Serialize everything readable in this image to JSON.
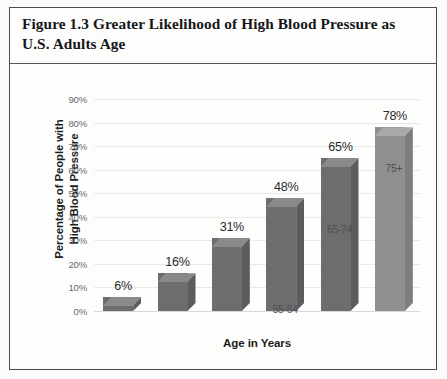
{
  "figure": {
    "title": "Figure 1.3 Greater Likelihood of High Blood Pressure as U.S. Adults Age"
  },
  "axis_titles": {
    "y_line1": "Percentage of People with",
    "y_line2": "High Blood Pressure",
    "x": "Age in Years"
  },
  "colors": {
    "bar_front": "#6d6d6f",
    "bar_side": "#5c5c5e",
    "bar_top": "#8a8a8c",
    "bar_front_last": "#8f8f91",
    "gridline": "#e9e9ea",
    "frame": "#4c4c50",
    "paper": "#fdfdfc"
  },
  "chart_data": {
    "type": "bar",
    "title": "Figure 1.3 Greater Likelihood of High Blood Pressure as U.S. Adults Age",
    "xlabel": "Age in Years",
    "ylabel": "Percentage of People with High Blood Pressure",
    "categories": [
      "18-34",
      "35-44",
      "45-54",
      "55-64",
      "65-74",
      "75+"
    ],
    "values": [
      6,
      16,
      31,
      48,
      65,
      78
    ],
    "value_labels": [
      "6%",
      "16%",
      "31%",
      "48%",
      "65%",
      "78%"
    ],
    "ylim": [
      0,
      90
    ],
    "ytick_values": [
      0,
      10,
      20,
      30,
      40,
      50,
      60,
      70,
      80,
      90
    ],
    "ytick_labels": [
      "0%",
      "10%",
      "20%",
      "30%",
      "40%",
      "50%",
      "60%",
      "70%",
      "80%",
      "90%"
    ],
    "grid": true,
    "legend": false,
    "style": "3d-column"
  }
}
